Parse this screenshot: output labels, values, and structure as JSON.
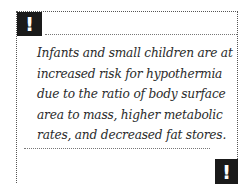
{
  "callout": {
    "icon_top": "!",
    "icon_bottom": "!",
    "icon_name": "exclamation-icon",
    "icon_bg": "#1a1a1a",
    "text": "Infants and small children are at increased risk for hypothermia due to the ratio of body surface area to mass, higher metabolic rates, and decreased fat stores."
  }
}
